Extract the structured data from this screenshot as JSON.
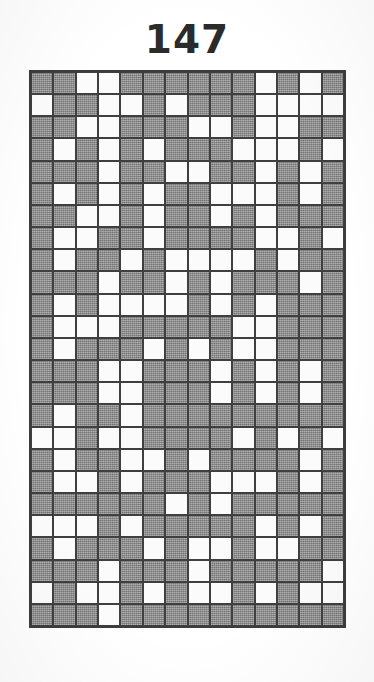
{
  "puzzle": {
    "title": "147",
    "type": "nonogram-solution-grid",
    "columns": 14,
    "rows": 25,
    "legend": {
      "filled_symbol": "#",
      "empty_symbol": ".",
      "filled_color": "#8d8d8d",
      "empty_color": "#fbfbfb",
      "grid_line_color": "#3f3f3f",
      "title_color": "#2b2b2b",
      "background_color": "#ffffff"
    },
    "grid": [
      "##..######.#.#",
      ".##..#.###....",
      "##..###..#..##",
      "#.#.#.###...#.",
      "###.##..##.#.#",
      "#.#.#.##...#.#",
      "##..#.##.#.###",
      "#..##.####..#.",
      "#.##.#....#.##",
      "###.##.#.###.#",
      "#.#....#.#.###",
      "#...#####..###",
      "#.###.#.#..###",
      "###..###.#.#.#",
      "###..###.#.#.#",
      "#.##.#########",
      "..#..####.#.#.",
      "#.##..#.####.#",
      "#..#.###...#.#",
      "######.#.#####",
      "...#.#####.#.#",
      "#.###.#..#..##",
      "###.###.#####.",
      ".#..#.#..#.#..",
      "###.##########"
    ]
  }
}
